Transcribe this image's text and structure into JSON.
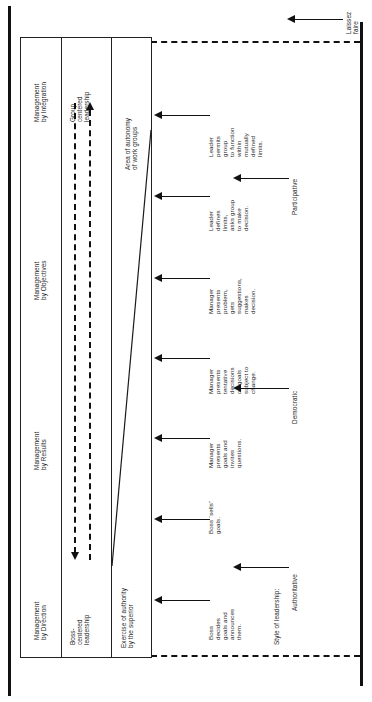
{
  "diagram": {
    "orientation": "rotated-90",
    "band_labels": {
      "authority_band": "Exercise of authority\nby the superior",
      "autonomy_band": "Area of autonomy\nof work groups",
      "boss_centered": "Boss-\ncentered\nleadership",
      "group_centered": "Group\ncentered\nleadership"
    },
    "management_styles": [
      {
        "label": "Management\nby Direction"
      },
      {
        "label": "Management\nby Results"
      },
      {
        "label": "Management\nby Objectives"
      },
      {
        "label": "Management\nby Integration"
      }
    ],
    "behaviours": [
      {
        "label": "Boss\ndecides\ngoals and\nannounces\nthem."
      },
      {
        "label": "Boss “sells”\ngoals."
      },
      {
        "label": "Manager\npresents\ngoals and\ninvites\nquestions."
      },
      {
        "label": "Manager\npresents\ntentative\ndecisions\non goals\nsubject to\nchange."
      },
      {
        "label": "Manager\npresents\nproblem,\ngets\nsuggestions,\nmakes\ndecision."
      },
      {
        "label": "Leader\ndefines\nlimits,\nasks group\nto make\ndecision."
      },
      {
        "label": "Leader\npermits\ngroup\nto function\nwithin\nmutually\ndefined\nlimits."
      }
    ],
    "style_axis": {
      "caption": "Style of leadership:",
      "styles": [
        {
          "label": "Authoritative"
        },
        {
          "label": "Democratic"
        },
        {
          "label": "Participative"
        },
        {
          "label": "Laissez\nfaire"
        }
      ]
    },
    "colors": {
      "ink": "#111111",
      "rule": "#222222",
      "paper": "#ffffff"
    }
  }
}
